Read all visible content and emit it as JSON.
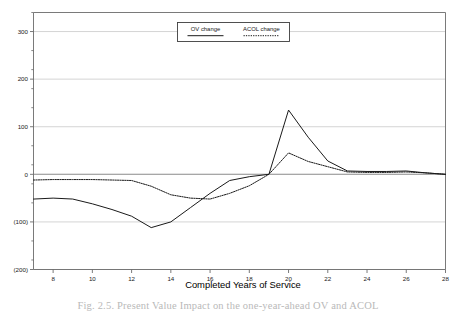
{
  "chart_data": {
    "type": "line",
    "title": "",
    "xlabel": "Completed Years of Service",
    "ylabel": "",
    "xlim": [
      7,
      28
    ],
    "ylim": [
      -200,
      340
    ],
    "grid": true,
    "grid_axis": "y",
    "legend_position": "top-center",
    "x_ticks": [
      8,
      10,
      12,
      14,
      16,
      18,
      20,
      22,
      24,
      26,
      28
    ],
    "x_tick_labels": [
      "8",
      "10",
      "12",
      "14",
      "16",
      "18",
      "20",
      "22",
      "24",
      "26",
      "28"
    ],
    "x_minor_ticks": [
      7,
      9,
      11,
      13,
      15,
      17,
      19,
      21,
      23,
      25,
      27
    ],
    "y_ticks": [
      300,
      200,
      100,
      0,
      -100,
      -200
    ],
    "y_tick_labels": [
      "300",
      "200",
      "100",
      "0",
      "(100)",
      "(200)"
    ],
    "y_minor_ticks": [
      340,
      260,
      220,
      180,
      140,
      60,
      20,
      -20,
      -60,
      -140,
      -180
    ],
    "x": [
      7,
      8,
      9,
      10,
      11,
      12,
      13,
      14,
      15,
      16,
      17,
      18,
      19,
      20,
      21,
      22,
      23,
      24,
      25,
      26,
      27,
      28
    ],
    "series": [
      {
        "name": "OV change",
        "style": "solid",
        "color": "#1a1a1a",
        "values": [
          -52,
          -50,
          -52,
          -62,
          -74,
          -88,
          -112,
          -100,
          -70,
          -40,
          -13,
          -5,
          0,
          135,
          78,
          28,
          7,
          6,
          6,
          7,
          3,
          0
        ]
      },
      {
        "name": "ACOL change",
        "style": "dotted",
        "color": "#1a1a1a",
        "values": [
          -12,
          -11,
          -11,
          -11,
          -12,
          -13,
          -25,
          -43,
          -50,
          -52,
          -40,
          -24,
          0,
          45,
          27,
          16,
          5,
          4,
          4,
          5,
          3,
          0
        ]
      }
    ]
  },
  "legend": {
    "entries": [
      {
        "label": "OV change",
        "style": "solid"
      },
      {
        "label": "ACOL change",
        "style": "dotted"
      }
    ]
  },
  "axis_titles": {
    "x": "Completed Years of Service"
  },
  "caption": {
    "text": "Fig. 2.5.  Present Value Impact on the one-year-ahead OV and ACOL"
  },
  "colors": {
    "frame": "#6b6b6b",
    "gridline": "#c9c9c9",
    "zero_line": "#8a8a8a",
    "line": "#1a1a1a",
    "text": "#1a1a1a"
  }
}
